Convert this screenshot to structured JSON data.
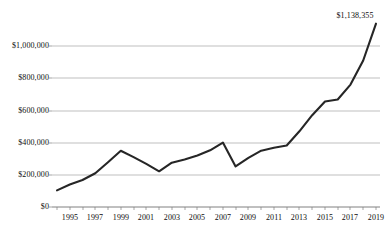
{
  "chart_data": {
    "type": "line",
    "title": "",
    "subtitle": "",
    "xlabel": "",
    "ylabel": "",
    "grid": true,
    "legend": "none",
    "xlim": [
      1994,
      2019
    ],
    "ylim": [
      0,
      1138355
    ],
    "y_ticks": [
      0,
      200000,
      400000,
      600000,
      800000,
      1000000
    ],
    "y_tick_labels": [
      "$0",
      "$200,000",
      "$400,000",
      "$600,000",
      "$800,000",
      "$1,000,000"
    ],
    "x_tick_labels": [
      "1995",
      "1997",
      "1999",
      "2001",
      "2003",
      "2005",
      "2007",
      "2009",
      "2011",
      "2013",
      "2015",
      "2017",
      "2019"
    ],
    "x": [
      1994,
      1995,
      1996,
      1997,
      1998,
      1999,
      2000,
      2001,
      2002,
      2003,
      2004,
      2005,
      2006,
      2007,
      2008,
      2009,
      2010,
      2011,
      2012,
      2013,
      2014,
      2015,
      2016,
      2017,
      2018,
      2019
    ],
    "categories": [
      "1994",
      "1995",
      "1996",
      "1997",
      "1998",
      "1999",
      "2000",
      "2001",
      "2002",
      "2003",
      "2004",
      "2005",
      "2006",
      "2007",
      "2008",
      "2009",
      "2010",
      "2011",
      "2012",
      "2013",
      "2014",
      "2015",
      "2016",
      "2017",
      "2018",
      "2019"
    ],
    "values": [
      103000,
      140000,
      168000,
      210000,
      278000,
      350000,
      310000,
      268000,
      222000,
      275000,
      295000,
      320000,
      352000,
      400000,
      252000,
      305000,
      350000,
      368000,
      382000,
      470000,
      570000,
      655000,
      668000,
      760000,
      910000,
      860000
    ],
    "series": [
      {
        "name": "value",
        "color": "#262626",
        "values": [
          103000,
          140000,
          168000,
          210000,
          278000,
          350000,
          310000,
          268000,
          222000,
          275000,
          295000,
          320000,
          352000,
          400000,
          252000,
          305000,
          350000,
          368000,
          382000,
          470000,
          570000,
          655000,
          668000,
          760000,
          910000,
          1138355
        ]
      }
    ],
    "annotations": [
      {
        "text": "$1,138,355",
        "x": 2019,
        "y": 1138355
      }
    ],
    "colors": {
      "line": "#262626",
      "gridline": "#bfbfbf",
      "axis": "#808080",
      "text": "#0d0d0d",
      "background": "#ffffff"
    }
  }
}
